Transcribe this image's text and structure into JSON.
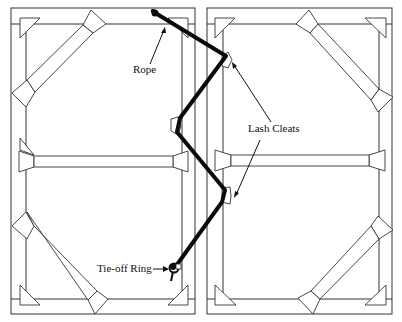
{
  "figure": {
    "labels": {
      "rope": "Rope",
      "lash_cleats": "Lash Cleats",
      "tie_off_ring": "Tie-off Ring"
    },
    "colors": {
      "line": "#333333",
      "rope": "#0a0a0a",
      "background": "#ffffff"
    }
  },
  "panels": [
    {
      "name": "left-panel",
      "outer": [
        11,
        8,
        184,
        306
      ],
      "inner": [
        26,
        24,
        156,
        275
      ]
    },
    {
      "name": "right-panel",
      "outer": [
        207,
        8,
        185,
        306
      ],
      "inner": [
        223,
        24,
        156,
        275
      ]
    }
  ],
  "rope_path": [
    [
      157,
      14
    ],
    [
      228,
      62
    ],
    [
      178,
      126
    ],
    [
      227,
      196
    ],
    [
      173,
      270
    ]
  ],
  "lash_cleats": [
    [
      228,
      64
    ],
    [
      178,
      126
    ],
    [
      227,
      196
    ]
  ],
  "tie_off_ring": [
    173,
    270
  ]
}
